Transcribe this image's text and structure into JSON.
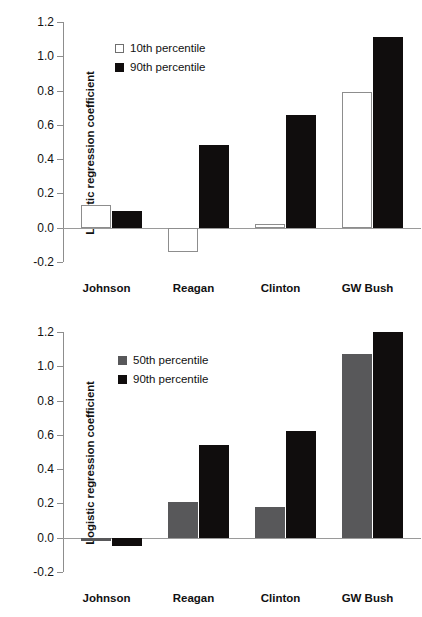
{
  "chart_data": [
    {
      "id": "top",
      "type": "bar",
      "title": "",
      "xlabel": "",
      "ylabel": "Logistic regression coefficient",
      "categories": [
        "Johnson",
        "Reagan",
        "Clinton",
        "GW Bush"
      ],
      "ylim": [
        -0.2,
        1.2
      ],
      "yticks": [
        "1.2",
        "1.0",
        "0.8",
        "0.6",
        "0.4",
        "0.2",
        "0.0",
        "-0.2"
      ],
      "ytick_values": [
        1.2,
        1.0,
        0.8,
        0.6,
        0.4,
        0.2,
        0.0,
        -0.2
      ],
      "grid": false,
      "legend_position": "upper-left",
      "series": [
        {
          "name": "10th percentile",
          "style": "open",
          "color": "#ffffff",
          "border": "#8d8d8d",
          "values": [
            0.13,
            -0.14,
            0.02,
            0.79
          ]
        },
        {
          "name": "90th percentile",
          "style": "filled",
          "color": "#100d0d",
          "values": [
            0.1,
            0.48,
            0.66,
            1.11
          ]
        }
      ]
    },
    {
      "id": "bottom",
      "type": "bar",
      "title": "",
      "xlabel": "",
      "ylabel": "Logistic regression coefficient",
      "categories": [
        "Johnson",
        "Reagan",
        "Clinton",
        "GW Bush"
      ],
      "ylim": [
        -0.2,
        1.2
      ],
      "yticks": [
        "1.2",
        "1.0",
        "0.8",
        "0.6",
        "0.4",
        "0.2",
        "0.0",
        "-0.2"
      ],
      "ytick_values": [
        1.2,
        1.0,
        0.8,
        0.6,
        0.4,
        0.2,
        0.0,
        -0.2
      ],
      "grid": false,
      "legend_position": "upper-left",
      "series": [
        {
          "name": "50th percentile",
          "style": "filled",
          "color": "#58585a",
          "values": [
            -0.02,
            0.21,
            0.18,
            1.07
          ]
        },
        {
          "name": "90th percentile",
          "style": "filled",
          "color": "#100d0d",
          "values": [
            -0.05,
            0.54,
            0.62,
            1.2
          ]
        }
      ]
    }
  ],
  "top_chart": {
    "ylabel": "Logistic regression coefficient",
    "yticks": [
      "1.2",
      "1.0",
      "0.8",
      "0.6",
      "0.4",
      "0.2",
      "0.0",
      "-0.2"
    ],
    "xlabels": [
      "Johnson",
      "Reagan",
      "Clinton",
      "GW Bush"
    ],
    "legend": [
      "10th percentile",
      "90th percentile"
    ]
  },
  "bottom_chart": {
    "ylabel": "Logistic regression coefficient",
    "yticks": [
      "1.2",
      "1.0",
      "0.8",
      "0.6",
      "0.4",
      "0.2",
      "0.0",
      "-0.2"
    ],
    "xlabels": [
      "Johnson",
      "Reagan",
      "Clinton",
      "GW Bush"
    ],
    "legend": [
      "50th percentile",
      "90th percentile"
    ]
  }
}
